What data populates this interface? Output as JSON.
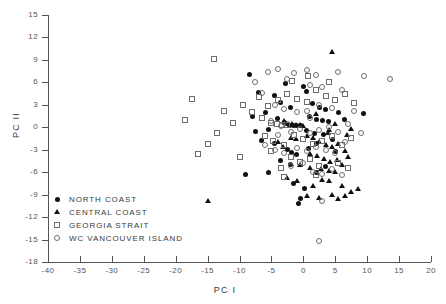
{
  "chart_data": {
    "type": "scatter",
    "title": "",
    "xlabel": "PC I",
    "ylabel": "PC II",
    "xlim": [
      -40,
      20
    ],
    "ylim": [
      -18,
      15
    ],
    "xticks": [
      -40,
      -35,
      -30,
      -25,
      -20,
      -15,
      -10,
      -5,
      0,
      5,
      10,
      15,
      20
    ],
    "yticks": [
      -18,
      -15,
      -12,
      -9,
      -6,
      -3,
      0,
      3,
      6,
      9,
      12,
      15
    ],
    "xtick_labels": [
      "-40",
      "-35",
      "-30",
      "-25",
      "-20",
      "-15",
      "-10",
      "-5",
      "0",
      "5",
      "10",
      "15",
      "20"
    ],
    "ytick_labels": [
      "-18",
      "-15",
      "-12",
      "-9",
      "-6",
      "-3",
      "0",
      "3",
      "6",
      "9",
      "12",
      "15"
    ],
    "grid": false,
    "legend_position": "lower-left-inside",
    "series": [
      {
        "name": "NORTH COAST",
        "marker": "filled-circle",
        "color": "#111111",
        "points": [
          [
            -8.5,
            7.0
          ],
          [
            -7.0,
            4.6
          ],
          [
            -4.5,
            4.2
          ],
          [
            -3.5,
            3.3
          ],
          [
            -2.0,
            2.7
          ],
          [
            -4.0,
            1.2
          ],
          [
            -3.0,
            0.6
          ],
          [
            -2.2,
            0.3
          ],
          [
            -1.5,
            0.2
          ],
          [
            -1.0,
            0.2
          ],
          [
            -0.5,
            0.2
          ],
          [
            -5.5,
            -0.3
          ],
          [
            -6.5,
            -1.8
          ],
          [
            -4.5,
            -2.2
          ],
          [
            -2.5,
            -3.0
          ],
          [
            -1.8,
            -3.4
          ],
          [
            -1.0,
            -3.6
          ],
          [
            -3.5,
            -4.5
          ],
          [
            -2.0,
            -5.0
          ],
          [
            -5.5,
            -6.0
          ],
          [
            -9.0,
            -6.3
          ],
          [
            0.5,
            4.8
          ],
          [
            1.5,
            3.2
          ],
          [
            2.5,
            2.6
          ],
          [
            3.5,
            2.4
          ],
          [
            1.0,
            1.4
          ],
          [
            2.0,
            1.0
          ],
          [
            3.0,
            0.9
          ],
          [
            4.0,
            0.8
          ],
          [
            0.5,
            -0.4
          ],
          [
            1.8,
            -0.8
          ],
          [
            3.2,
            -1.0
          ],
          [
            2.0,
            -2.2
          ],
          [
            0.8,
            -2.8
          ],
          [
            4.5,
            -1.6
          ],
          [
            5.5,
            2.0
          ],
          [
            6.5,
            1.0
          ],
          [
            9.5,
            1.8
          ],
          [
            -1.5,
            -7.5
          ],
          [
            0.2,
            -8.2
          ],
          [
            -0.5,
            -9.5
          ],
          [
            -0.8,
            -10.2
          ],
          [
            2.0,
            -6.0
          ],
          [
            3.5,
            -5.2
          ],
          [
            5.0,
            -3.2
          ],
          [
            -6.0,
            2.0
          ],
          [
            -7.5,
            -0.5
          ],
          [
            -8.0,
            1.5
          ],
          [
            0.0,
            5.5
          ],
          [
            -2.8,
            5.8
          ]
        ]
      },
      {
        "name": "CENTRAL COAST",
        "marker": "filled-triangle",
        "color": "#111111",
        "points": [
          [
            4.5,
            10.0
          ],
          [
            -3.0,
            0.8
          ],
          [
            -2.4,
            0.5
          ],
          [
            -1.8,
            0.4
          ],
          [
            -1.2,
            0.3
          ],
          [
            -0.6,
            0.3
          ],
          [
            0.0,
            0.2
          ],
          [
            -2.0,
            -1.4
          ],
          [
            -1.2,
            -1.6
          ],
          [
            0.5,
            -1.2
          ],
          [
            1.5,
            -1.4
          ],
          [
            2.5,
            -2.0
          ],
          [
            3.5,
            -2.4
          ],
          [
            4.5,
            -2.6
          ],
          [
            5.5,
            -2.2
          ],
          [
            6.5,
            -3.2
          ],
          [
            1.0,
            -3.6
          ],
          [
            2.2,
            -3.8
          ],
          [
            3.2,
            -4.2
          ],
          [
            4.2,
            -4.6
          ],
          [
            5.2,
            -4.4
          ],
          [
            2.8,
            -5.6
          ],
          [
            4.0,
            -5.8
          ],
          [
            5.0,
            -6.0
          ],
          [
            3.0,
            -7.0
          ],
          [
            4.0,
            -7.2
          ],
          [
            1.5,
            -7.8
          ],
          [
            -1.0,
            -7.2
          ],
          [
            -2.5,
            -6.8
          ],
          [
            6.0,
            -5.0
          ],
          [
            7.0,
            -4.0
          ],
          [
            6.8,
            -1.0
          ],
          [
            7.5,
            -0.2
          ],
          [
            5.0,
            0.4
          ],
          [
            4.0,
            -0.4
          ],
          [
            -15.0,
            -9.8
          ],
          [
            0.5,
            -9.2
          ],
          [
            2.5,
            -9.4
          ],
          [
            4.5,
            -9.0
          ],
          [
            5.5,
            -9.6
          ],
          [
            6.5,
            -9.2
          ],
          [
            7.5,
            -8.6
          ],
          [
            8.5,
            -8.2
          ],
          [
            -4.0,
            -2.0
          ],
          [
            -3.2,
            -2.6
          ],
          [
            -0.5,
            -5.0
          ],
          [
            1.0,
            -5.4
          ],
          [
            3.8,
            -0.8
          ],
          [
            6.0,
            -7.8
          ],
          [
            2.0,
            1.8
          ]
        ]
      },
      {
        "name": "GEORGIA STRAIT",
        "marker": "open-square",
        "color": "#6e6e6e",
        "points": [
          [
            -14.0,
            9.1
          ],
          [
            -17.5,
            3.8
          ],
          [
            -18.5,
            1.0
          ],
          [
            -15.0,
            -2.2
          ],
          [
            -16.5,
            -3.6
          ],
          [
            -12.5,
            2.2
          ],
          [
            -11.0,
            0.6
          ],
          [
            -13.5,
            -0.8
          ],
          [
            -9.5,
            3.0
          ],
          [
            -8.0,
            2.0
          ],
          [
            -6.5,
            1.2
          ],
          [
            -5.0,
            0.6
          ],
          [
            -4.2,
            0.4
          ],
          [
            -3.4,
            0.3
          ],
          [
            -2.6,
            0.3
          ],
          [
            -5.5,
            2.8
          ],
          [
            -4.0,
            3.6
          ],
          [
            -2.5,
            4.4
          ],
          [
            -1.0,
            3.8
          ],
          [
            0.5,
            3.4
          ],
          [
            2.0,
            5.0
          ],
          [
            3.5,
            4.2
          ],
          [
            5.0,
            3.6
          ],
          [
            6.5,
            4.4
          ],
          [
            8.0,
            3.2
          ],
          [
            -6.0,
            -1.2
          ],
          [
            -4.8,
            -1.8
          ],
          [
            -3.0,
            -2.4
          ],
          [
            -1.5,
            -1.0
          ],
          [
            0.0,
            -1.6
          ],
          [
            1.5,
            -2.2
          ],
          [
            3.0,
            -1.8
          ],
          [
            4.5,
            -1.2
          ],
          [
            6.0,
            -2.4
          ],
          [
            7.5,
            -1.4
          ],
          [
            -2.0,
            -4.0
          ],
          [
            -0.5,
            -4.6
          ],
          [
            1.0,
            -4.2
          ],
          [
            2.5,
            -5.2
          ],
          [
            -3.5,
            -5.4
          ],
          [
            -5.0,
            -3.2
          ],
          [
            5.5,
            -4.8
          ],
          [
            7.0,
            -5.4
          ],
          [
            -7.0,
            4.0
          ],
          [
            -10.0,
            -4.0
          ],
          [
            -1.8,
            6.2
          ],
          [
            0.8,
            6.8
          ],
          [
            4.0,
            6.0
          ],
          [
            -3.0,
            -6.6
          ],
          [
            2.0,
            -6.4
          ]
        ]
      },
      {
        "name": "WC VANCOUVER ISLAND",
        "marker": "open-circle",
        "color": "#6e6e6e",
        "points": [
          [
            -5.5,
            7.4
          ],
          [
            -4.0,
            7.8
          ],
          [
            -1.5,
            7.2
          ],
          [
            0.5,
            7.6
          ],
          [
            2.0,
            7.0
          ],
          [
            5.5,
            7.4
          ],
          [
            9.5,
            6.8
          ],
          [
            13.5,
            6.4
          ],
          [
            -2.5,
            6.4
          ],
          [
            1.0,
            5.6
          ],
          [
            3.0,
            5.4
          ],
          [
            6.0,
            5.0
          ],
          [
            -6.5,
            4.6
          ],
          [
            -4.5,
            3.0
          ],
          [
            -3.0,
            2.4
          ],
          [
            -1.0,
            2.0
          ],
          [
            0.5,
            2.2
          ],
          [
            2.5,
            3.0
          ],
          [
            4.5,
            2.6
          ],
          [
            8.0,
            2.2
          ],
          [
            -5.0,
            0.8
          ],
          [
            -3.5,
            0.2
          ],
          [
            -2.0,
            -0.6
          ],
          [
            -0.5,
            -0.2
          ],
          [
            1.0,
            -0.8
          ],
          [
            2.5,
            -0.4
          ],
          [
            4.0,
            0.0
          ],
          [
            5.5,
            -0.6
          ],
          [
            7.0,
            0.4
          ],
          [
            9.0,
            -0.8
          ],
          [
            -6.0,
            -2.4
          ],
          [
            -4.5,
            -3.0
          ],
          [
            -3.0,
            -3.4
          ],
          [
            -1.0,
            -2.8
          ],
          [
            0.5,
            -3.2
          ],
          [
            2.0,
            -2.6
          ],
          [
            3.5,
            -3.0
          ],
          [
            5.0,
            -3.4
          ],
          [
            6.5,
            -2.0
          ],
          [
            -2.0,
            -5.2
          ],
          [
            0.0,
            -4.8
          ],
          [
            1.5,
            -6.0
          ],
          [
            3.0,
            -6.2
          ],
          [
            4.5,
            -5.6
          ],
          [
            6.0,
            -6.4
          ],
          [
            -4.0,
            -1.0
          ],
          [
            1.0,
            1.2
          ],
          [
            3.0,
            -9.8
          ],
          [
            2.5,
            -15.2
          ],
          [
            -7.5,
            6.0
          ]
        ]
      }
    ]
  },
  "legend": {
    "items": [
      {
        "label": "NORTH  COAST",
        "marker": "filled-circle"
      },
      {
        "label": "CENTRAL  COAST",
        "marker": "filled-triangle"
      },
      {
        "label": "GEORGIA  STRAIT",
        "marker": "open-square"
      },
      {
        "label": "WC  VANCOUVER  ISLAND",
        "marker": "open-circle"
      }
    ]
  },
  "colors": {
    "filled": "#111111",
    "open": "#6e6e6e",
    "axis": "#555555",
    "text": "#3a3a3a",
    "background": "#ffffff"
  }
}
